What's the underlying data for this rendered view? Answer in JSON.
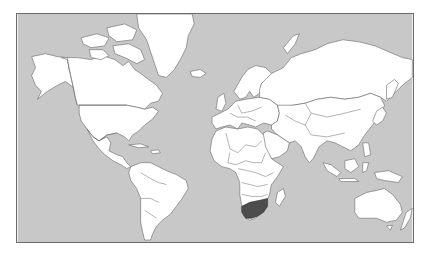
{
  "map": {
    "projection": "Mercator",
    "highlighted_country": "South Africa",
    "colors": {
      "ocean": "#c8c8c8",
      "land": "#ffffff",
      "border": "#666666",
      "highlight": "#4d4d4d",
      "frame": "#6a6a6a"
    }
  }
}
